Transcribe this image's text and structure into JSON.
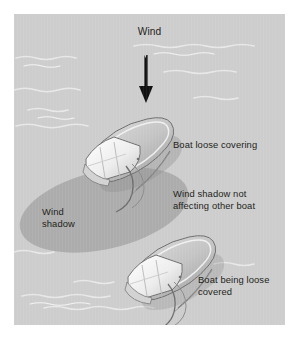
{
  "figure": {
    "background_color": "#ffffff",
    "plate_color": "#cdcdcd",
    "shadow_color": "#a9a9a9",
    "ink_color": "#231f20"
  },
  "labels": {
    "wind": "Wind",
    "boat_loose_covering": "Boat loose covering",
    "wind_shadow_not_affecting": "Wind shadow not\naffecting other boat",
    "boat_being_loose_covered": "Boat being loose\ncovered",
    "wind_shadow": "Wind\nshadow"
  },
  "icons": {
    "wind_arrow": "down-arrow-icon",
    "upper_boat": "boat-icon",
    "lower_boat": "boat-icon",
    "shadow": "ellipse-shadow-icon",
    "water": "water-waves-icon"
  }
}
